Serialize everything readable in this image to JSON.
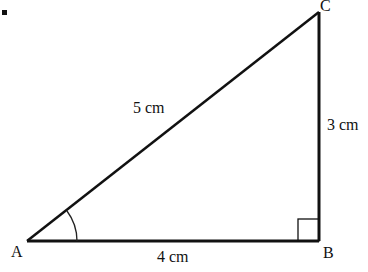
{
  "figure": {
    "bullet": "•",
    "vertices": {
      "A": {
        "label": "A",
        "x": 27,
        "y": 241
      },
      "B": {
        "label": "B",
        "x": 319,
        "y": 241
      },
      "C": {
        "label": "C",
        "x": 319,
        "y": 12
      }
    },
    "sides": {
      "AC": {
        "label": "5 cm"
      },
      "BC": {
        "label": "3 cm"
      },
      "AB": {
        "label": "4 cm"
      }
    },
    "angle_marker_at": "A",
    "right_angle_at": "B",
    "colors": {
      "stroke": "#111111",
      "background": "#ffffff"
    }
  }
}
